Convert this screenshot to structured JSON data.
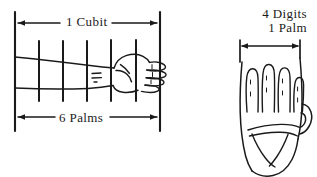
{
  "figure": {
    "ink_color": "#1a1a1a",
    "background_color": "#ffffff"
  },
  "left_panel": {
    "name": "forearm-cubit-diagram",
    "top_measure": {
      "label": "1 Cubit",
      "arrow_style": "double-headed"
    },
    "bottom_measure": {
      "label": "6 Palms",
      "arrow_style": "double-headed"
    },
    "subdivisions": 6,
    "description": "Forearm and hand spanning six palm-width divisions"
  },
  "right_panel": {
    "name": "palm-digits-diagram",
    "label_line_1": "4 Digits",
    "label_line_2": "1 Palm",
    "top_measure": {
      "arrow_style": "double-headed"
    },
    "digit_count": 4,
    "description": "Open palm showing four finger widths equal to one palm"
  }
}
